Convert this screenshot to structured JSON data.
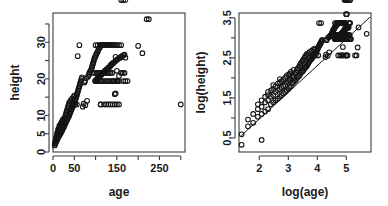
{
  "figure": {
    "width": 388,
    "height": 206,
    "background": "#ffffff",
    "foreground": "#151515",
    "panel_count": 2,
    "layout": "1 row x 2 columns"
  },
  "chart_data": [
    {
      "type": "scatter",
      "panel": "left",
      "title": "",
      "xlabel": "age",
      "ylabel": "height",
      "xlim": [
        0,
        310
      ],
      "ylim": [
        0,
        38
      ],
      "grid": false,
      "legend": null,
      "point_marker": "open-circle",
      "xticks": [
        0,
        50,
        100,
        150,
        200,
        250,
        300
      ],
      "xtick_labels": [
        "0",
        "50",
        "",
        "150",
        "",
        "250",
        ""
      ],
      "yticks": [
        0,
        5,
        10,
        15,
        20,
        25,
        30,
        35
      ],
      "ytick_labels": [
        "0",
        "5",
        "10",
        "",
        "20",
        "",
        "30",
        ""
      ],
      "x": [
        4,
        5,
        5,
        6,
        6,
        7,
        7,
        7,
        8,
        8,
        8,
        9,
        9,
        9,
        10,
        10,
        10,
        10,
        11,
        11,
        11,
        12,
        12,
        12,
        12,
        13,
        13,
        13,
        14,
        14,
        14,
        15,
        15,
        15,
        15,
        16,
        16,
        16,
        17,
        17,
        17,
        18,
        18,
        18,
        19,
        19,
        19,
        20,
        20,
        20,
        21,
        21,
        21,
        22,
        22,
        22,
        23,
        23,
        24,
        24,
        24,
        25,
        25,
        26,
        26,
        27,
        27,
        28,
        28,
        29,
        29,
        30,
        30,
        31,
        31,
        32,
        32,
        33,
        33,
        34,
        34,
        35,
        35,
        36,
        36,
        37,
        37,
        38,
        38,
        39,
        40,
        40,
        41,
        42,
        42,
        43,
        44,
        45,
        45,
        46,
        47,
        48,
        48,
        49,
        50,
        50,
        51,
        52,
        53,
        54,
        55,
        56,
        57,
        58,
        59,
        60,
        61,
        62,
        63,
        64,
        65,
        66,
        67,
        68,
        70,
        72,
        74,
        75,
        76,
        78,
        80,
        82,
        84,
        85,
        86,
        88,
        90,
        91,
        92,
        93,
        94,
        95,
        96,
        97,
        98,
        99,
        100,
        100,
        101,
        102,
        103,
        104,
        105,
        105,
        106,
        107,
        108,
        109,
        110,
        110,
        111,
        112,
        113,
        114,
        115,
        115,
        116,
        117,
        118,
        119,
        120,
        120,
        121,
        122,
        123,
        124,
        125,
        126,
        127,
        128,
        129,
        130,
        131,
        132,
        133,
        134,
        135,
        136,
        138,
        140,
        142,
        144,
        146,
        148,
        150,
        152,
        155,
        158,
        160,
        162,
        165,
        168,
        170,
        58,
        62,
        100,
        105,
        110,
        112,
        115,
        118,
        120,
        122,
        125,
        128,
        130,
        132,
        135,
        138,
        140,
        142,
        145,
        148,
        150,
        155,
        160,
        165,
        170,
        175,
        100,
        104,
        108,
        112,
        116,
        120,
        124,
        128,
        132,
        136,
        140,
        144,
        148,
        152,
        156,
        160,
        164,
        168,
        95,
        99,
        103,
        107,
        111,
        115,
        119,
        123,
        127,
        131,
        135,
        139,
        143,
        147,
        151,
        200,
        210,
        220,
        225,
        300,
        112,
        145,
        147,
        150,
        155,
        46,
        52,
        56,
        112,
        120,
        125,
        130,
        135,
        140,
        145,
        150,
        155,
        160,
        165,
        170
      ],
      "y": [
        1.8,
        2.2,
        2.6,
        2.4,
        3.0,
        2.8,
        3.4,
        3.8,
        3.0,
        3.6,
        4.2,
        3.2,
        4.0,
        4.6,
        3.4,
        4.2,
        4.8,
        5.2,
        3.8,
        4.6,
        5.4,
        4.0,
        4.8,
        5.6,
        6.2,
        4.2,
        5.2,
        6.0,
        4.4,
        5.4,
        6.4,
        4.6,
        5.6,
        6.6,
        7.2,
        4.8,
        5.8,
        6.8,
        5.0,
        6.0,
        7.0,
        5.2,
        6.2,
        7.4,
        5.4,
        6.6,
        7.8,
        5.6,
        6.8,
        8.0,
        5.8,
        7.0,
        8.2,
        6.0,
        7.2,
        8.6,
        6.4,
        7.6,
        6.6,
        7.8,
        9.0,
        6.8,
        8.2,
        7.0,
        8.6,
        7.4,
        9.0,
        7.6,
        9.4,
        7.8,
        9.8,
        8.0,
        10.2,
        8.4,
        10.6,
        8.6,
        11.0,
        8.8,
        11.4,
        9.0,
        11.8,
        9.4,
        12.2,
        9.6,
        12.6,
        9.8,
        13.0,
        10.0,
        13.4,
        10.4,
        10.6,
        13.8,
        11.0,
        11.2,
        14.2,
        11.6,
        11.8,
        12.0,
        14.6,
        12.4,
        12.6,
        12.8,
        15.0,
        13.2,
        13.4,
        15.4,
        13.8,
        14.0,
        14.4,
        14.8,
        15.2,
        15.6,
        16.0,
        16.4,
        16.8,
        17.2,
        17.6,
        18.0,
        18.4,
        18.8,
        19.2,
        19.6,
        20.0,
        20.4,
        12.4,
        13.2,
        19.0,
        19.4,
        12.8,
        20.2,
        14.0,
        20.6,
        21.0,
        21.4,
        21.8,
        22.2,
        22.6,
        23.0,
        23.4,
        23.8,
        24.2,
        24.6,
        25.0,
        25.4,
        25.8,
        19.4,
        26.2,
        19.6,
        26.6,
        19.8,
        27.0,
        20.0,
        27.4,
        20.2,
        27.8,
        20.4,
        28.2,
        20.6,
        28.6,
        20.8,
        29.0,
        21.0,
        29.2,
        21.2,
        29.2,
        21.4,
        29.2,
        21.6,
        29.2,
        21.8,
        29.2,
        22.0,
        29.2,
        22.2,
        29.2,
        22.4,
        29.2,
        22.6,
        29.2,
        22.8,
        29.2,
        23.0,
        29.2,
        23.2,
        29.2,
        23.4,
        23.6,
        23.8,
        24.0,
        24.2,
        24.4,
        24.6,
        24.8,
        25.0,
        25.2,
        25.4,
        25.6,
        25.8,
        26.0,
        26.2,
        26.4,
        26.6,
        25.8,
        26.2,
        29.2,
        29.2,
        29.2,
        29.2,
        29.2,
        29.2,
        29.2,
        29.2,
        29.2,
        29.2,
        29.2,
        29.2,
        29.2,
        29.2,
        29.2,
        29.2,
        29.2,
        29.2,
        29.2,
        29.2,
        29.2,
        29.2,
        19.4,
        19.4,
        19.4,
        19.4,
        19.4,
        19.4,
        19.4,
        19.4,
        19.4,
        19.4,
        19.4,
        19.4,
        19.4,
        19.4,
        19.4,
        19.4,
        19.4,
        19.4,
        21.6,
        21.6,
        21.6,
        21.6,
        21.6,
        21.6,
        21.6,
        21.6,
        21.6,
        21.6,
        21.6,
        21.6,
        21.6,
        21.6,
        21.6,
        19.4,
        16.0,
        19.4,
        29.0,
        27.0,
        36.3,
        36.3,
        13.0,
        13.0,
        15.8,
        26.0,
        22.2,
        20.8,
        13.0,
        13.0,
        13.0,
        13.0,
        13.0,
        13.0,
        13.0,
        13.0,
        13.0,
        13.0,
        13.0,
        13.0
      ]
    },
    {
      "type": "scatter",
      "panel": "right",
      "title": "",
      "xlabel": "log(age)",
      "ylabel": "log(height)",
      "xlim": [
        1.3,
        5.85
      ],
      "ylim": [
        0.15,
        3.62
      ],
      "grid": false,
      "legend": null,
      "point_marker": "open-circle",
      "xticks": [
        2,
        3,
        4,
        5
      ],
      "xtick_labels": [
        "2",
        "3",
        "4",
        "5"
      ],
      "yticks": [
        0.5,
        1.0,
        1.5,
        2.0,
        2.5,
        3.0,
        3.5
      ],
      "ytick_labels": [
        "0.5",
        "",
        "1.5",
        "",
        "2.5",
        "",
        "3.5"
      ],
      "fit_line": {
        "type": "linear",
        "x_from": 1.38,
        "y_from": 0.56,
        "x_to": 5.82,
        "y_to": 3.52,
        "slope": 0.666,
        "intercept": -0.359
      },
      "x": [
        1.39,
        1.61,
        1.61,
        1.79,
        1.79,
        1.95,
        1.95,
        1.95,
        2.08,
        2.08,
        2.08,
        2.2,
        2.2,
        2.2,
        2.3,
        2.3,
        2.3,
        2.3,
        2.4,
        2.4,
        2.4,
        2.48,
        2.48,
        2.48,
        2.48,
        2.56,
        2.56,
        2.56,
        2.64,
        2.64,
        2.64,
        2.71,
        2.71,
        2.71,
        2.71,
        2.77,
        2.77,
        2.77,
        2.83,
        2.83,
        2.83,
        2.89,
        2.89,
        2.89,
        2.94,
        2.94,
        2.94,
        3.0,
        3.0,
        3.0,
        3.04,
        3.04,
        3.04,
        3.09,
        3.09,
        3.09,
        3.14,
        3.14,
        3.18,
        3.18,
        3.18,
        3.22,
        3.22,
        3.26,
        3.26,
        3.3,
        3.3,
        3.33,
        3.33,
        3.37,
        3.37,
        3.4,
        3.4,
        3.43,
        3.43,
        3.47,
        3.47,
        3.5,
        3.5,
        3.53,
        3.53,
        3.56,
        3.56,
        3.58,
        3.58,
        3.61,
        3.61,
        3.64,
        3.64,
        3.66,
        3.69,
        3.69,
        3.71,
        3.74,
        3.74,
        3.76,
        3.78,
        3.81,
        3.81,
        3.83,
        3.85,
        3.87,
        3.87,
        3.89,
        3.91,
        3.91,
        3.93,
        3.95,
        3.97,
        3.99,
        4.01,
        4.03,
        4.04,
        4.06,
        4.08,
        4.09,
        4.11,
        4.13,
        4.14,
        4.16,
        4.17,
        4.28,
        4.3,
        4.32,
        4.33,
        4.36,
        4.38,
        4.41,
        4.43,
        4.44,
        4.45,
        4.48,
        4.5,
        4.51,
        4.52,
        4.53,
        4.54,
        4.55,
        4.56,
        4.57,
        4.58,
        4.6,
        4.61,
        4.61,
        4.62,
        4.62,
        4.63,
        4.64,
        4.65,
        4.65,
        4.66,
        4.67,
        4.68,
        4.69,
        4.7,
        4.7,
        4.71,
        4.72,
        4.73,
        4.74,
        4.74,
        4.75,
        4.76,
        4.77,
        4.78,
        4.79,
        4.79,
        4.8,
        4.8,
        4.81,
        4.82,
        4.83,
        4.84,
        4.84,
        4.85,
        4.86,
        4.86,
        4.87,
        4.88,
        4.89,
        4.89,
        4.9,
        4.9,
        4.91,
        4.92,
        4.93,
        4.93,
        4.94,
        4.95,
        4.96,
        4.97,
        4.98,
        4.99,
        5.0,
        5.01,
        5.02,
        5.03,
        5.04,
        5.05,
        5.06,
        5.07,
        5.08,
        5.09,
        5.11,
        5.13,
        4.06,
        4.13,
        4.61,
        4.65,
        4.7,
        4.72,
        4.74,
        4.77,
        4.79,
        4.8,
        4.83,
        4.85,
        4.87,
        4.88,
        4.91,
        4.93,
        4.94,
        4.96,
        4.98,
        5.0,
        5.01,
        5.04,
        5.08,
        5.11,
        5.14,
        5.16,
        4.61,
        4.64,
        4.68,
        4.72,
        4.75,
        4.79,
        4.82,
        4.85,
        4.88,
        4.91,
        4.94,
        4.97,
        5.0,
        5.02,
        5.05,
        5.08,
        5.1,
        5.12,
        4.55,
        4.6,
        4.63,
        4.67,
        4.71,
        4.74,
        4.78,
        4.81,
        4.84,
        4.88,
        4.91,
        4.93,
        4.96,
        4.99,
        5.02,
        5.3,
        5.35,
        5.39,
        5.42,
        5.7,
        4.72,
        4.98,
        5.0,
        5.01,
        5.04,
        3.83,
        3.95,
        4.03,
        4.72,
        4.79,
        4.83,
        4.87,
        4.91,
        4.94,
        4.98,
        5.01,
        5.04,
        5.08,
        5.11,
        5.14
      ],
      "y": [
        0.59,
        0.79,
        0.96,
        0.88,
        1.1,
        1.03,
        1.22,
        1.34,
        1.1,
        1.28,
        1.44,
        1.16,
        1.39,
        1.53,
        1.22,
        1.44,
        1.57,
        1.65,
        1.34,
        1.53,
        1.69,
        1.39,
        1.57,
        1.72,
        1.82,
        1.44,
        1.65,
        1.79,
        1.48,
        1.69,
        1.86,
        1.53,
        1.72,
        1.89,
        1.97,
        1.57,
        1.76,
        1.92,
        1.61,
        1.79,
        1.95,
        1.65,
        1.82,
        2.0,
        1.69,
        1.89,
        2.05,
        1.72,
        1.92,
        2.08,
        1.76,
        1.95,
        2.1,
        1.79,
        1.97,
        2.15,
        1.86,
        2.03,
        1.89,
        2.05,
        2.2,
        1.92,
        2.1,
        1.95,
        2.15,
        2.0,
        2.2,
        2.03,
        2.24,
        2.05,
        2.28,
        2.08,
        2.32,
        2.13,
        2.36,
        2.15,
        2.4,
        2.17,
        2.43,
        2.2,
        2.47,
        2.24,
        2.5,
        2.26,
        2.53,
        2.28,
        2.56,
        2.3,
        2.6,
        2.34,
        2.36,
        2.62,
        2.4,
        2.42,
        2.65,
        2.45,
        2.47,
        2.48,
        2.68,
        2.52,
        2.53,
        2.55,
        2.71,
        2.58,
        2.6,
        2.73,
        2.62,
        2.64,
        2.67,
        2.69,
        2.72,
        2.75,
        2.77,
        2.8,
        2.82,
        2.84,
        2.86,
        2.89,
        2.91,
        2.93,
        2.95,
        2.52,
        2.58,
        2.94,
        2.97,
        2.55,
        3.01,
        2.64,
        3.03,
        3.04,
        3.06,
        3.08,
        3.1,
        3.12,
        3.14,
        3.15,
        3.17,
        3.19,
        3.2,
        3.22,
        3.23,
        3.25,
        2.97,
        3.27,
        2.98,
        3.28,
        2.99,
        3.3,
        3.0,
        3.31,
        3.01,
        3.33,
        3.02,
        3.34,
        3.03,
        3.35,
        3.03,
        3.37,
        3.04,
        3.37,
        3.05,
        3.37,
        3.06,
        3.37,
        3.08,
        3.37,
        3.08,
        3.37,
        3.09,
        3.37,
        3.1,
        3.37,
        3.11,
        3.37,
        3.12,
        3.37,
        3.13,
        3.37,
        3.14,
        3.37,
        3.15,
        3.37,
        3.16,
        3.17,
        3.17,
        3.18,
        3.19,
        3.2,
        3.2,
        3.21,
        3.22,
        3.23,
        3.23,
        3.24,
        3.25,
        3.26,
        3.27,
        3.27,
        3.28,
        3.28,
        3.25,
        3.27,
        3.37,
        3.37,
        3.37,
        3.37,
        3.37,
        3.37,
        3.37,
        3.37,
        3.37,
        3.37,
        3.37,
        3.37,
        3.37,
        3.37,
        3.37,
        3.37,
        3.37,
        3.37,
        3.37,
        3.37,
        3.37,
        3.37,
        2.97,
        2.97,
        2.97,
        2.97,
        2.97,
        2.97,
        2.97,
        2.97,
        2.97,
        2.97,
        2.97,
        2.97,
        2.97,
        2.97,
        2.97,
        2.97,
        2.97,
        2.97,
        3.07,
        3.07,
        3.07,
        3.07,
        3.07,
        3.07,
        3.07,
        3.07,
        3.07,
        3.07,
        3.07,
        3.07,
        3.07,
        3.07,
        3.07,
        2.97,
        2.77,
        2.97,
        3.37,
        3.3,
        3.59,
        3.59,
        2.56,
        2.56,
        2.76,
        3.26,
        3.1,
        3.03,
        2.56,
        2.56,
        2.56,
        2.56,
        2.56,
        2.56,
        2.56,
        2.56,
        2.56,
        2.56,
        2.56,
        2.56
      ],
      "low_outliers": [
        {
          "x": 1.39,
          "y": 0.33
        },
        {
          "x": 2.08,
          "y": 0.45
        }
      ]
    }
  ],
  "axis_titles": {
    "left_x": "age",
    "left_y": "height",
    "right_x": "log(age)",
    "right_y": "log(height)"
  }
}
